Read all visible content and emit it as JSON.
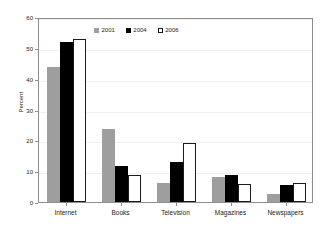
{
  "chart_data": {
    "type": "bar",
    "title": "",
    "subtitle": "",
    "xlabel": "",
    "ylabel": "Percent",
    "ylim": [
      0,
      60
    ],
    "ytick_step": 10,
    "yticks": [
      0,
      10,
      20,
      30,
      40,
      50,
      60
    ],
    "ytick_labels": [
      "0",
      "10",
      "20",
      "30",
      "40",
      "50",
      "60"
    ],
    "grid": true,
    "grid_axis": "y",
    "legend_position": "top-center",
    "categories": [
      "Internet",
      "Books",
      "Television",
      "Magazines",
      "Newspapers"
    ],
    "series": [
      {
        "name": "2001",
        "color": "#9e9e9e",
        "values": [
          43.7,
          23.8,
          6.2,
          8.2,
          2.7
        ]
      },
      {
        "name": "2004",
        "color": "#000000",
        "values": [
          51.8,
          11.6,
          13.0,
          8.7,
          5.6
        ]
      },
      {
        "name": "2006",
        "color": "#ffffff",
        "values": [
          52.8,
          8.9,
          19.1,
          5.8,
          6.3
        ]
      }
    ]
  },
  "legend": {
    "items": [
      {
        "label": "2001"
      },
      {
        "label": "2004"
      },
      {
        "label": "2006"
      }
    ]
  },
  "axes": {
    "y_title": "Percent"
  }
}
